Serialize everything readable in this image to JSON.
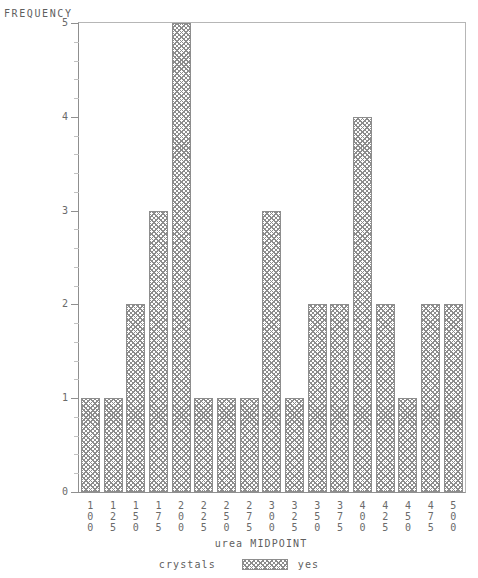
{
  "chart_data": {
    "type": "bar",
    "title": "",
    "xlabel": "urea MIDPOINT",
    "ylabel": "FREQUENCY",
    "categories": [
      "100",
      "125",
      "150",
      "175",
      "200",
      "225",
      "250",
      "275",
      "300",
      "325",
      "350",
      "375",
      "400",
      "425",
      "450",
      "475",
      "500"
    ],
    "values": [
      1,
      1,
      2,
      3,
      5,
      1,
      1,
      1,
      3,
      1,
      2,
      2,
      4,
      2,
      1,
      2,
      2
    ],
    "ylim": [
      0,
      5
    ],
    "y_ticks": [
      "0",
      "1",
      "2",
      "3",
      "4",
      "5"
    ],
    "grid": false,
    "legend_position": "bottom",
    "series": [
      {
        "name": "yes",
        "values": [
          1,
          1,
          2,
          3,
          5,
          1,
          1,
          1,
          3,
          1,
          2,
          2,
          4,
          2,
          1,
          2,
          2
        ]
      }
    ]
  },
  "legend": {
    "title": "crystals",
    "entry_label": "yes"
  },
  "colors": {
    "bar_hatch": "#8c8c8c",
    "bar_border": "#8d8d8d",
    "axis": "#8f8f8f",
    "frame": "#b6b6b6",
    "text": "#6a6a6a",
    "background": "#ffffff"
  }
}
